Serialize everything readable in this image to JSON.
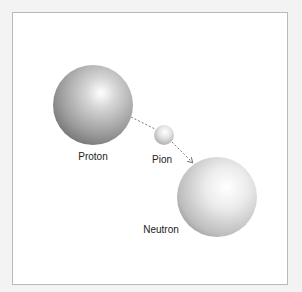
{
  "diagram": {
    "colors": {
      "background": "#f3f3f3",
      "frame": "#ffffff",
      "frame_border": "#b9b9b9",
      "arrow": "#777777"
    },
    "particles": [
      {
        "id": "proton",
        "label": "Proton",
        "cx": 93,
        "cy": 105,
        "r": 40,
        "label_x": 93,
        "label_y": 151
      },
      {
        "id": "pion",
        "label": "Pion",
        "cx": 164,
        "cy": 135,
        "r": 10,
        "label_x": 162,
        "label_y": 154
      },
      {
        "id": "neutron",
        "label": "Neutron",
        "cx": 217,
        "cy": 197,
        "r": 40,
        "label_x": 161,
        "label_y": 224
      }
    ],
    "exchange": {
      "from": "proton",
      "via": "pion",
      "to": "neutron",
      "style": "dashed-arrow"
    }
  }
}
